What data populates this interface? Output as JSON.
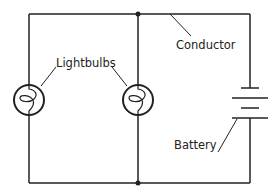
{
  "diagram": {
    "type": "parallel-circuit",
    "labels": {
      "lightbulbs": "Lightbulbs",
      "conductor": "Conductor",
      "battery": "Battery"
    },
    "components": [
      {
        "kind": "lightbulb",
        "position": "left-branch"
      },
      {
        "kind": "lightbulb",
        "position": "middle-branch"
      },
      {
        "kind": "battery",
        "position": "right-branch",
        "cells": 2
      },
      {
        "kind": "junction",
        "position": "top-middle"
      },
      {
        "kind": "junction",
        "position": "bottom-middle"
      }
    ],
    "colors": {
      "line": "#222222",
      "background": "#ffffff"
    }
  }
}
